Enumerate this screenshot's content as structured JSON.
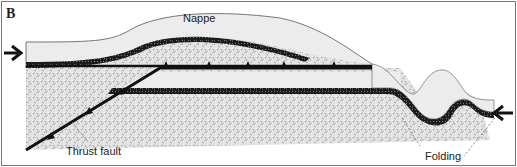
{
  "figure": {
    "panel_letter": "B",
    "labels": {
      "nappe": "Nappe",
      "thrust_fault": "Thrust fault",
      "folding": "Folding"
    },
    "icons": {
      "left_arrow": "arrow-right-icon",
      "right_arrow": "arrow-left-icon"
    },
    "colors": {
      "background": "#ffffff",
      "light_layer": "#ebebeb",
      "speckled_layer": "#d8d8d8",
      "dark_band": "#222222",
      "fault_line": "#111111",
      "frame": "#777777"
    }
  }
}
